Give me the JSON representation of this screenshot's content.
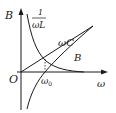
{
  "diagram": {
    "type": "susceptance-vs-frequency",
    "axes": {
      "y_label": "B",
      "x_label": "ω",
      "origin_label": "O"
    },
    "curves": [
      {
        "name": "inductive",
        "label_num": "1",
        "label_den": "ωL"
      },
      {
        "name": "capacitive",
        "label": "ωC"
      },
      {
        "name": "total",
        "label": "B"
      }
    ],
    "marker": {
      "label": "ω",
      "subscript": "0"
    },
    "colors": {
      "stroke": "#1a1a1a",
      "background": "#ffffff"
    }
  }
}
